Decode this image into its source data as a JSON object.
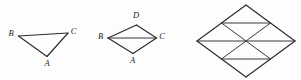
{
  "panel": {
    "name": "geometry-figures-panel",
    "background_color": "#fdfdfd",
    "stroke_color": "#2b2b2b",
    "label_color": "#1c1c1c",
    "width": 301,
    "height": 80
  },
  "figures": [
    {
      "id": "figure-1",
      "name": "triangle-abc",
      "shape": "triangle",
      "vertices": [
        {
          "label": "B",
          "x": 18.5,
          "y": 36.0,
          "label_x": 11.0,
          "label_y": 34.5
        },
        {
          "label": "C",
          "x": 68.0,
          "y": 33.0,
          "label_x": 73.5,
          "label_y": 32.0
        },
        {
          "label": "A",
          "x": 47.0,
          "y": 56.5,
          "label_x": 47.0,
          "label_y": 64.0
        }
      ],
      "edges": [
        {
          "name": "segment-bc",
          "points": "18.5,36.0 68.0,33.0"
        },
        {
          "name": "segment-ca",
          "points": "68.0,33.0 47.0,56.5"
        },
        {
          "name": "segment-ab",
          "points": "47.0,56.5 18.5,36.0"
        }
      ]
    },
    {
      "id": "figure-2",
      "name": "quadrilateral-bdca",
      "shape": "kite",
      "vertices": [
        {
          "label": "B",
          "x": 108.0,
          "y": 38.0,
          "label_x": 100.5,
          "label_y": 37.5
        },
        {
          "label": "D",
          "x": 136.5,
          "y": 25.0,
          "label_x": 136.0,
          "label_y": 16.5
        },
        {
          "label": "C",
          "x": 156.5,
          "y": 38.0,
          "label_x": 162.0,
          "label_y": 37.5
        },
        {
          "label": "A",
          "x": 133.0,
          "y": 53.5,
          "label_x": 132.5,
          "label_y": 61.5
        }
      ],
      "edges": [
        {
          "name": "segment-bd",
          "points": "108.0,38.0 136.5,25.0"
        },
        {
          "name": "segment-dc",
          "points": "136.5,25.0 156.5,38.0"
        },
        {
          "name": "segment-ca",
          "points": "156.5,38.0 133.0,53.5"
        },
        {
          "name": "segment-ab",
          "points": "133.0,53.5 108.0,38.0"
        }
      ],
      "diagonals": [
        {
          "name": "diagonal-bc",
          "points": "108.0,38.0 156.5,38.0"
        }
      ]
    },
    {
      "id": "figure-3",
      "name": "subdivided-rhombus",
      "shape": "rhombus-with-triangles",
      "vertices": [
        {
          "label": "",
          "x": 197.0,
          "y": 41.0
        },
        {
          "label": "",
          "x": 246.0,
          "y": 5.0
        },
        {
          "label": "",
          "x": 295.0,
          "y": 41.0
        },
        {
          "label": "",
          "x": 246.0,
          "y": 77.0
        }
      ],
      "edges": [
        {
          "name": "outline-left-top",
          "points": "197.0,41.0 246.0,5.0"
        },
        {
          "name": "outline-top-right",
          "points": "246.0,5.0 295.0,41.0"
        },
        {
          "name": "outline-right-bottom",
          "points": "295.0,41.0 246.0,77.0"
        },
        {
          "name": "outline-bottom-left",
          "points": "246.0,77.0 197.0,41.0"
        }
      ],
      "interior_lines": [
        {
          "name": "chord-horizontal-upper",
          "points": "221.5,23.0 270.5,23.0"
        },
        {
          "name": "chord-horizontal-lower",
          "points": "221.5,59.0 270.5,59.0"
        },
        {
          "name": "diagonal-horizontal-main",
          "points": "197.0,41.0 295.0,41.0"
        },
        {
          "name": "diagonal-upper-left",
          "points": "221.5,23.0 246.0,41.0"
        },
        {
          "name": "diagonal-upper-right",
          "points": "270.5,23.0 246.0,41.0"
        },
        {
          "name": "diagonal-lower-left",
          "points": "221.5,59.0 246.0,41.0"
        },
        {
          "name": "diagonal-lower-right",
          "points": "270.5,59.0 246.0,41.0"
        }
      ]
    }
  ]
}
